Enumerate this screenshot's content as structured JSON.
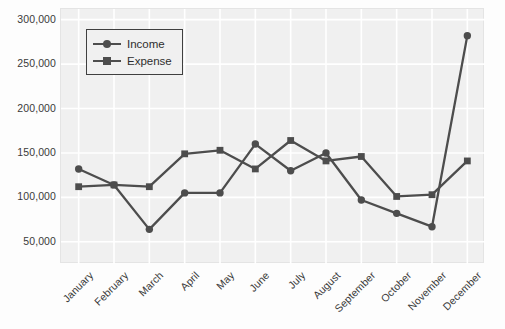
{
  "chart_data": {
    "type": "line",
    "title": "",
    "xlabel": "",
    "ylabel": "",
    "categories": [
      "January",
      "February",
      "March",
      "April",
      "May",
      "June",
      "July",
      "August",
      "September",
      "October",
      "November",
      "December"
    ],
    "series": [
      {
        "name": "Income",
        "marker": "circle",
        "color": "#4d4d4d",
        "values": [
          132000,
          114000,
          64000,
          105000,
          105000,
          160000,
          130000,
          150000,
          97000,
          82000,
          67000,
          282000
        ]
      },
      {
        "name": "Expense",
        "marker": "square",
        "color": "#4d4d4d",
        "values": [
          112000,
          114000,
          112000,
          149000,
          153000,
          132000,
          164000,
          141000,
          146000,
          101000,
          103000,
          141000
        ]
      }
    ],
    "ylim": [
      25000,
      312000
    ],
    "yticks": [
      50000,
      100000,
      150000,
      200000,
      250000,
      300000
    ],
    "ytick_labels": [
      "50,000",
      "100,000",
      "150,000",
      "200,000",
      "250,000",
      "300,000"
    ],
    "grid": true,
    "grid_color": "#ffffff",
    "plot_background": "#f0f0f0",
    "legend_position": "upper-left"
  }
}
